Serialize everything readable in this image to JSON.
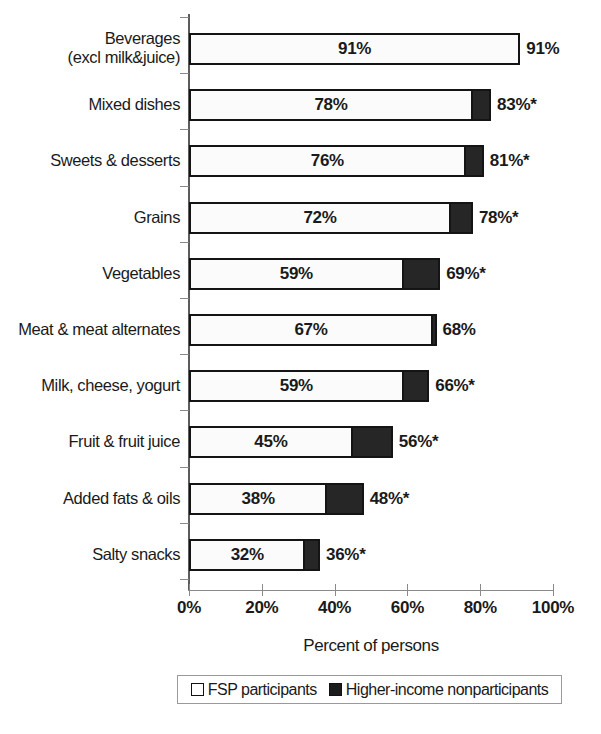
{
  "chart_data": {
    "type": "bar",
    "orientation": "horizontal",
    "stacked": true,
    "title": "",
    "xlabel": "Percent of persons",
    "ylabel": "",
    "xlim": [
      0,
      100
    ],
    "xticks": [
      "0%",
      "20%",
      "40%",
      "60%",
      "80%",
      "100%"
    ],
    "xtick_values": [
      0,
      20,
      40,
      60,
      80,
      100
    ],
    "grid": false,
    "legend_position": "bottom",
    "categories": [
      "Beverages\n(excl milk&juice)",
      "Mixed dishes",
      "Sweets & desserts",
      "Grains",
      "Vegetables",
      "Meat & meat alternates",
      "Milk, cheese, yogurt",
      "Fruit & fruit juice",
      "Added fats & oils",
      "Salty snacks"
    ],
    "series": [
      {
        "name": "FSP participants",
        "color": "#fbfbfb",
        "values": [
          91,
          78,
          76,
          72,
          59,
          67,
          59,
          45,
          38,
          32
        ]
      },
      {
        "name": "Higher-income nonparticipants",
        "color": "#262626",
        "values": [
          91,
          83,
          81,
          78,
          69,
          68,
          66,
          56,
          48,
          36
        ]
      }
    ],
    "bar_inner_labels": [
      "91%",
      "78%",
      "76%",
      "72%",
      "59%",
      "67%",
      "59%",
      "45%",
      "38%",
      "32%"
    ],
    "bar_end_labels": [
      "91%",
      "83%*",
      "81%*",
      "78%*",
      "69%*",
      "68%",
      "66%*",
      "56%*",
      "48%*",
      "36%*"
    ],
    "significance_marker": "*"
  },
  "legend": {
    "items": [
      {
        "label": "FSP participants",
        "swatch": "light"
      },
      {
        "label": "Higher-income nonparticipants",
        "swatch": "dark"
      }
    ]
  }
}
